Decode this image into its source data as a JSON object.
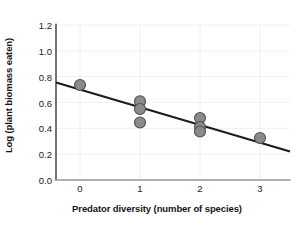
{
  "chart_data": {
    "type": "scatter",
    "title": "",
    "xlabel": "Predator diversity (number of species)",
    "ylabel": "Log (plant biomass eaten)",
    "xlim": [
      -0.4,
      3.5
    ],
    "ylim": [
      0.0,
      1.2
    ],
    "xticks": [
      0,
      1,
      2,
      3
    ],
    "xtick_labels": [
      "0",
      "1",
      "2",
      "3"
    ],
    "yticks": [
      0.0,
      0.2,
      0.4,
      0.6,
      0.8,
      1.0,
      1.2
    ],
    "ytick_labels": [
      "0.0",
      "0.2",
      "0.4",
      "0.6",
      "0.8",
      "1.0",
      "1.2"
    ],
    "grid": true,
    "legend": false,
    "marker_color": "#8a8a8a",
    "marker_edge_color": "#4f4f4f",
    "marker_size": 11,
    "line_color": "#1c1c1c",
    "grid_color": "#f0f0f0",
    "axis_color": "#3a3a3a",
    "points": [
      {
        "x": 0,
        "y": 0.735
      },
      {
        "x": 1,
        "y": 0.61
      },
      {
        "x": 1,
        "y": 0.55
      },
      {
        "x": 1,
        "y": 0.445
      },
      {
        "x": 2,
        "y": 0.48
      },
      {
        "x": 2,
        "y": 0.41
      },
      {
        "x": 2,
        "y": 0.375
      },
      {
        "x": 3,
        "y": 0.325
      }
    ],
    "trendline": {
      "x": [
        -0.4,
        3.5
      ],
      "y": [
        0.755,
        0.221
      ]
    }
  }
}
